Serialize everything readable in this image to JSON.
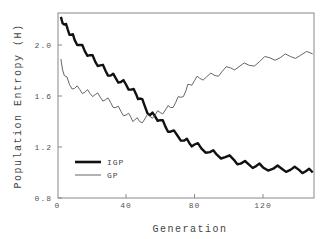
{
  "chart_data": {
    "type": "line",
    "title": "",
    "xlabel": "Generation",
    "ylabel": "Population Entropy (H)",
    "xlim": [
      0,
      150
    ],
    "ylim": [
      0.8,
      2.25
    ],
    "xticks": [
      0,
      40,
      80,
      120
    ],
    "xtick_labels": [
      "0",
      "40",
      "80",
      "120"
    ],
    "yticks": [
      0.8,
      1.2,
      1.6,
      2.0
    ],
    "ytick_labels": [
      "0.8",
      "1.2",
      "1.6",
      "2.0"
    ],
    "grid": false,
    "legend_position": "bottom-left",
    "series": [
      {
        "name": "IGP",
        "style": "thick",
        "color": "#111111",
        "x": [
          2,
          4,
          6,
          8,
          10,
          13,
          16,
          19,
          22,
          25,
          28,
          31,
          34,
          37,
          40,
          43,
          46,
          48,
          51,
          54,
          57,
          60,
          63,
          66,
          70,
          74,
          77,
          80,
          84,
          89,
          93,
          98,
          103,
          107,
          112,
          116,
          120,
          126,
          131,
          136,
          141,
          145,
          149
        ],
        "values": [
          2.22,
          2.16,
          2.12,
          2.08,
          2.04,
          2.0,
          1.95,
          1.92,
          1.87,
          1.84,
          1.8,
          1.76,
          1.74,
          1.71,
          1.69,
          1.65,
          1.61,
          1.58,
          1.52,
          1.45,
          1.44,
          1.41,
          1.36,
          1.32,
          1.29,
          1.25,
          1.23,
          1.22,
          1.19,
          1.16,
          1.14,
          1.12,
          1.1,
          1.07,
          1.06,
          1.05,
          1.04,
          1.03,
          1.03,
          1.02,
          1.02,
          1.01,
          1.0
        ]
      },
      {
        "name": "GP",
        "style": "thin",
        "color": "#555555",
        "x": [
          2,
          4,
          7,
          10,
          13,
          16,
          19,
          22,
          25,
          28,
          31,
          34,
          37,
          40,
          43,
          45,
          48,
          51,
          54,
          57,
          60,
          63,
          66,
          69,
          72,
          75,
          77,
          80,
          83,
          87,
          92,
          96,
          101,
          106,
          112,
          118,
          124,
          130,
          136,
          142,
          149
        ],
        "values": [
          1.89,
          1.76,
          1.69,
          1.66,
          1.65,
          1.63,
          1.62,
          1.61,
          1.59,
          1.57,
          1.55,
          1.51,
          1.48,
          1.45,
          1.43,
          1.41,
          1.4,
          1.42,
          1.44,
          1.45,
          1.47,
          1.49,
          1.51,
          1.55,
          1.59,
          1.64,
          1.69,
          1.72,
          1.74,
          1.75,
          1.76,
          1.79,
          1.82,
          1.83,
          1.84,
          1.87,
          1.9,
          1.9,
          1.91,
          1.92,
          1.93
        ]
      }
    ]
  }
}
